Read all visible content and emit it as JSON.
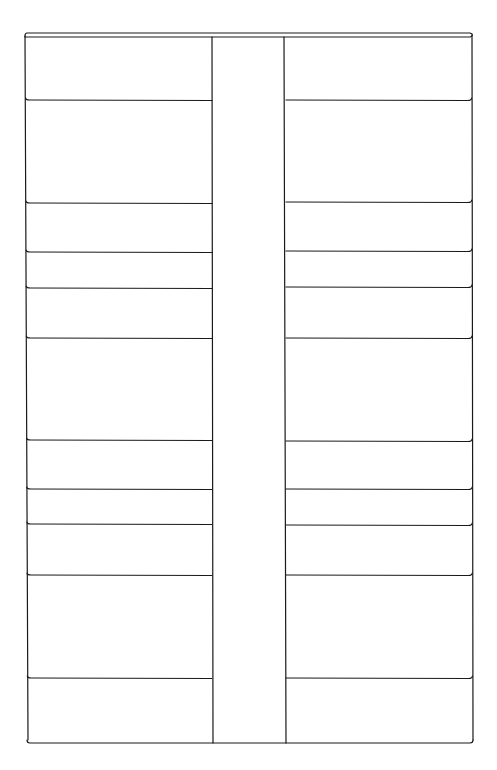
{
  "diagram": {
    "type": "line-drawing-layout",
    "stroke_color": "#1a1a1a",
    "background": "#ffffff",
    "outer": {
      "left_top_x": 25,
      "left_bottom_x": 27,
      "right_top_x": 472,
      "right_bottom_x": 473,
      "top_y": 35,
      "bottom_y": 743
    },
    "corridor": {
      "left_x": 212,
      "right_x": 286
    },
    "left_column_dividers_y": [
      100,
      203,
      252,
      288,
      338,
      440,
      489,
      524,
      575,
      678
    ],
    "right_column_dividers_y": [
      100,
      202,
      251,
      287,
      338,
      441,
      489,
      525,
      575,
      678
    ]
  }
}
